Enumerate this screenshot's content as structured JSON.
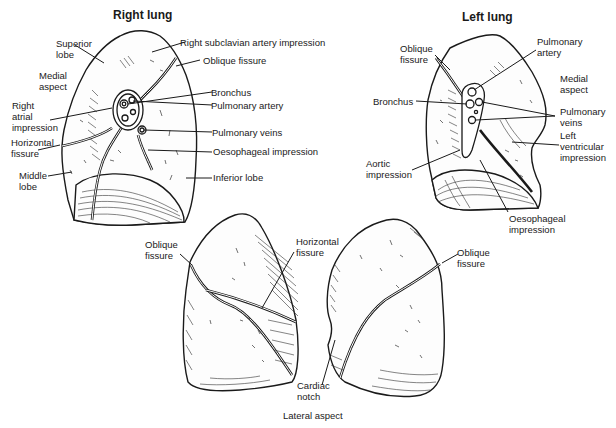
{
  "figure": {
    "panels": [
      {
        "id": "right-lung-medial",
        "title": "Right lung",
        "labels": [
          {
            "key": "superior_lobe",
            "text": "Superior\nlobe"
          },
          {
            "key": "medial_aspect",
            "text": "Medial\naspect"
          },
          {
            "key": "right_atrial_impression",
            "text": "Right\natrial\nimpression"
          },
          {
            "key": "horizontal_fissure",
            "text": "Horizontal\nfissure"
          },
          {
            "key": "middle_lobe",
            "text": "Middle\nlobe"
          },
          {
            "key": "right_subclavian_artery_impression",
            "text": "Right subclavian artery impression"
          },
          {
            "key": "oblique_fissure",
            "text": "Oblique fissure"
          },
          {
            "key": "bronchus",
            "text": "Bronchus"
          },
          {
            "key": "pulmonary_artery",
            "text": "Pulmonary artery"
          },
          {
            "key": "pulmonary_veins",
            "text": "Pulmonary veins"
          },
          {
            "key": "oesophageal_impression",
            "text": "Oesophageal impression"
          },
          {
            "key": "inferior_lobe",
            "text": "Inferior lobe"
          }
        ]
      },
      {
        "id": "left-lung-medial",
        "title": "Left lung",
        "labels": [
          {
            "key": "oblique_fissure",
            "text": "Oblique\nfissure"
          },
          {
            "key": "bronchus",
            "text": "Bronchus"
          },
          {
            "key": "aortic_impression",
            "text": "Aortic\nimpression"
          },
          {
            "key": "pulmonary_artery",
            "text": "Pulmonary\nartery"
          },
          {
            "key": "medial_aspect",
            "text": "Medial\naspect"
          },
          {
            "key": "pulmonary_veins",
            "text": "Pulmonary\nveins"
          },
          {
            "key": "left_ventricular_impression",
            "text": "Left\nventricular\nimpression"
          },
          {
            "key": "oesophageal_impression",
            "text": "Oesophageal\nimpression"
          }
        ]
      },
      {
        "id": "lateral-views",
        "caption": "Lateral aspect",
        "labels": [
          {
            "key": "oblique_fissure_right",
            "text": "Oblique\nfissure"
          },
          {
            "key": "horizontal_fissure",
            "text": "Horizontal\nfissure"
          },
          {
            "key": "cardiac_notch",
            "text": "Cardiac\nnotch"
          },
          {
            "key": "oblique_fissure_left",
            "text": "Oblique\nfissure"
          }
        ]
      }
    ]
  }
}
